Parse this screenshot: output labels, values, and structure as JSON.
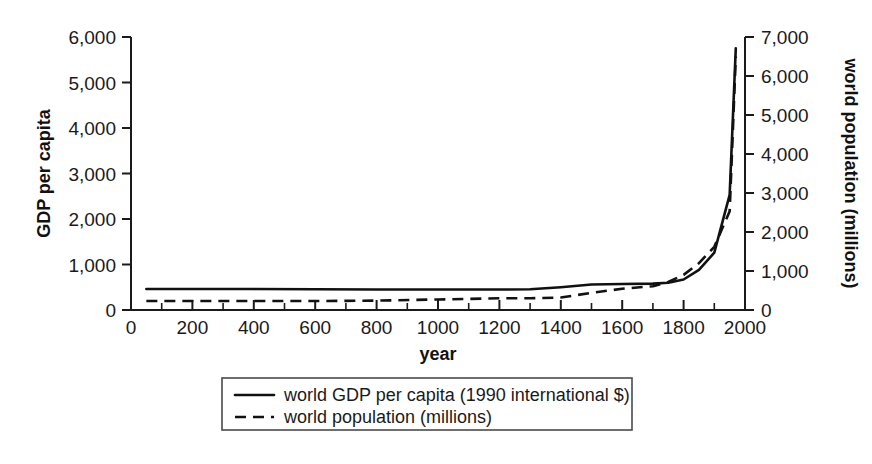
{
  "chart_data": {
    "type": "line",
    "title": "",
    "xlabel": "year",
    "ylabel": "GDP per capita",
    "y2label": "world population (millions)",
    "xlim": [
      0,
      2000
    ],
    "ylim": [
      0,
      6000
    ],
    "y2lim": [
      0,
      7000
    ],
    "grid": false,
    "legend_position": "below-center",
    "xticks": [
      "0",
      "200",
      "400",
      "600",
      "800",
      "1000",
      "1200",
      "1400",
      "1600",
      "1800",
      "2000"
    ],
    "xtick_values": [
      0,
      200,
      400,
      600,
      800,
      1000,
      1200,
      1400,
      1600,
      1800,
      2000
    ],
    "xminor_step": 100,
    "yticks": [
      "0",
      "1,000",
      "2,000",
      "3,000",
      "4,000",
      "5,000",
      "6,000"
    ],
    "ytick_values": [
      0,
      1000,
      2000,
      3000,
      4000,
      5000,
      6000
    ],
    "y2ticks": [
      "0",
      "1,000",
      "2,000",
      "3,000",
      "4,000",
      "5,000",
      "6,000",
      "7,000"
    ],
    "y2tick_values": [
      0,
      1000,
      2000,
      3000,
      4000,
      5000,
      6000,
      7000
    ],
    "series": [
      {
        "name": "world GDP per capita (1990 international $)",
        "axis": "left",
        "style": "solid",
        "color": "#111111",
        "x": [
          50,
          200,
          400,
          600,
          800,
          1000,
          1200,
          1300,
          1400,
          1500,
          1600,
          1700,
          1750,
          1800,
          1850,
          1900,
          1950,
          1970
        ],
        "values": [
          460,
          460,
          460,
          455,
          450,
          450,
          450,
          455,
          500,
          560,
          570,
          580,
          600,
          670,
          880,
          1260,
          2530,
          5750
        ]
      },
      {
        "name": "world population (millions)",
        "axis": "right",
        "style": "dashed",
        "color": "#111111",
        "x": [
          50,
          200,
          400,
          600,
          800,
          1000,
          1200,
          1300,
          1400,
          1500,
          1600,
          1700,
          1750,
          1800,
          1850,
          1900,
          1950,
          1970
        ],
        "values": [
          230,
          230,
          230,
          230,
          240,
          270,
          300,
          300,
          320,
          440,
          545,
          610,
          720,
          900,
          1200,
          1620,
          2530,
          6500
        ]
      }
    ]
  },
  "legend": {
    "entries": [
      {
        "label": "world GDP per capita (1990 international $)",
        "style": "solid"
      },
      {
        "label": "world population (millions)",
        "style": "dashed"
      }
    ]
  },
  "colors": {
    "ink": "#111111",
    "axis": "#1a1a1a",
    "background": "#ffffff",
    "legend_border": "#4a4a4a"
  }
}
